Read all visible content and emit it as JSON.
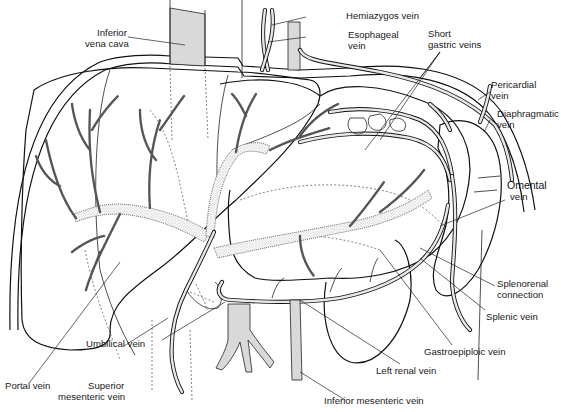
{
  "figure": {
    "type": "anatomical line illustration"
  },
  "labels": {
    "inferior_vena_cava": {
      "line1": "Inferior",
      "line2": "vena cava"
    },
    "hemiazygos_vein": "Hemiazygos vein",
    "esophageal_vein": {
      "line1": "Esophageal",
      "line2": "vein"
    },
    "short_gastric_veins": {
      "line1": "Short",
      "line2": "gastric veins"
    },
    "pericardial_vein": {
      "line1": "Pericardial",
      "line2": "vein"
    },
    "diaphragmatic_vein": {
      "line1": "Diaphragmatic",
      "line2": "vein"
    },
    "omental_vein": {
      "line1": "Omental",
      "line2": "vein"
    },
    "splenorenal_connection": {
      "line1": "Splenorenal",
      "line2": "connection"
    },
    "splenic_vein": "Splenic vein",
    "gastroepiploic_vein": "Gastroepiploic vein",
    "left_renal_vein": "Left renal vein",
    "inferior_mesenteric_vein": "Inferior mesenteric vein",
    "superior_mesenteric_vein": {
      "line1": "Superior",
      "line2": "mesenteric vein"
    },
    "umbilical_vein": "Umbilical vein",
    "portal_vein": "Portal vein"
  },
  "colors": {
    "ink": "#111111",
    "background": "#ffffff"
  }
}
